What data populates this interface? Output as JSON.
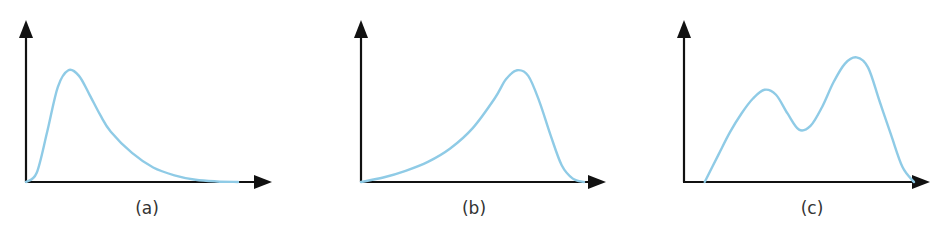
{
  "chart_data": [
    {
      "type": "line",
      "title": "",
      "caption": "(a)",
      "description": "Unimodal distribution, positively skewed (peak left, long right tail)",
      "xlabel": "",
      "ylabel": "",
      "x": [
        0,
        0.05,
        0.1,
        0.15,
        0.2,
        0.25,
        0.3,
        0.35,
        0.4,
        0.5,
        0.6,
        0.7,
        0.8,
        0.9,
        1.0
      ],
      "y": [
        0,
        0.08,
        0.45,
        0.85,
        1.0,
        0.95,
        0.78,
        0.6,
        0.45,
        0.26,
        0.13,
        0.06,
        0.02,
        0.005,
        0
      ],
      "xlim": [
        0,
        1
      ],
      "ylim": [
        0,
        1.45
      ],
      "grid": false
    },
    {
      "type": "line",
      "title": "",
      "caption": "(b)",
      "description": "Unimodal distribution, negatively skewed (long left tail, peak right)",
      "xlabel": "",
      "ylabel": "",
      "x": [
        0,
        0.1,
        0.2,
        0.3,
        0.4,
        0.5,
        0.6,
        0.65,
        0.7,
        0.75,
        0.8,
        0.85,
        0.9,
        0.95,
        1.0
      ],
      "y": [
        0,
        0.04,
        0.1,
        0.18,
        0.3,
        0.48,
        0.75,
        0.92,
        1.0,
        0.95,
        0.72,
        0.42,
        0.15,
        0.03,
        0
      ],
      "xlim": [
        0,
        1
      ],
      "ylim": [
        0,
        1.45
      ],
      "grid": false
    },
    {
      "type": "line",
      "title": "",
      "caption": "(c)",
      "description": "Bimodal distribution (two peaks, right peak higher)",
      "xlabel": "",
      "ylabel": "",
      "x": [
        0.09,
        0.15,
        0.2,
        0.25,
        0.3,
        0.35,
        0.4,
        0.45,
        0.5,
        0.55,
        0.6,
        0.65,
        0.7,
        0.75,
        0.8,
        0.85,
        0.9,
        0.95,
        1.0
      ],
      "y": [
        0,
        0.22,
        0.4,
        0.55,
        0.67,
        0.74,
        0.7,
        0.55,
        0.42,
        0.45,
        0.6,
        0.8,
        0.95,
        1.0,
        0.92,
        0.65,
        0.38,
        0.12,
        0
      ],
      "xlim": [
        0,
        1
      ],
      "ylim": [
        0,
        1.3
      ],
      "grid": false
    }
  ],
  "style": {
    "curve_color": "#8fcbe6",
    "axis_color": "#111111",
    "caption_color": "#333333"
  }
}
